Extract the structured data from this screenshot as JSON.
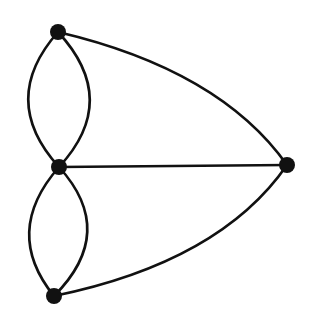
{
  "diagram": {
    "type": "multigraph",
    "edge_color": "#111111",
    "node_color": "#111111",
    "background": "#ffffff",
    "nodes": [
      {
        "id": "A",
        "label": "",
        "x": 58,
        "y": 32
      },
      {
        "id": "B",
        "label": "",
        "x": 59,
        "y": 167
      },
      {
        "id": "C",
        "label": "",
        "x": 54,
        "y": 296
      },
      {
        "id": "D",
        "label": "",
        "x": 287,
        "y": 165
      }
    ],
    "edges": [
      {
        "from": "A",
        "to": "B",
        "curve": "left"
      },
      {
        "from": "A",
        "to": "B",
        "curve": "right"
      },
      {
        "from": "B",
        "to": "C",
        "curve": "left"
      },
      {
        "from": "B",
        "to": "C",
        "curve": "right"
      },
      {
        "from": "A",
        "to": "D",
        "curve": "outward"
      },
      {
        "from": "B",
        "to": "D",
        "curve": "straight"
      },
      {
        "from": "C",
        "to": "D",
        "curve": "outward"
      }
    ]
  }
}
